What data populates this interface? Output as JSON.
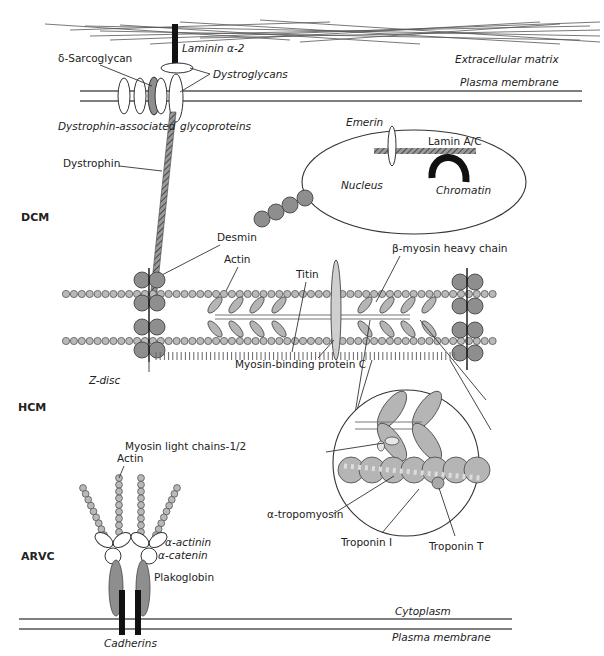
{
  "figure": {
    "regions": {
      "dcm": "DCM",
      "hcm": "HCM",
      "arvc": "ARVC"
    },
    "labels": {
      "laminin": "Laminin α-2",
      "extracellular_matrix": "Extracellular matrix",
      "plasma_membrane_top": "Plasma membrane",
      "delta_sarcoglycan": "δ-Sarcoglycan",
      "dystroglycans": "Dystroglycans",
      "dystrophin_associated": "Dystrophin-associated",
      "glycoproteins": "glycoproteins",
      "dystrophin": "Dystrophin",
      "emerin": "Emerin",
      "lamin_ac": "Lamin A/C",
      "nucleus": "Nucleus",
      "chromatin": "Chromatin",
      "desmin": "Desmin",
      "actin_sarcomere": "Actin",
      "titin": "Titin",
      "beta_myosin": "β-myosin heavy chain",
      "z_disc": "Z-disc",
      "mybpc": "Myosin-binding protein C",
      "myosin_light_chains": "Myosin light chains-1/2",
      "alpha_tropomyosin": "α-tropomyosin",
      "troponin_i": "Troponin I",
      "troponin_t": "Troponin T",
      "actin_arvc": "Actin",
      "alpha_actinin": "α-actinin",
      "alpha_catenin": "α-catenin",
      "plakoglobin": "Plakoglobin",
      "cadherins": "Cadherins",
      "cytoplasm": "Cytoplasm",
      "plasma_membrane_bottom": "Plasma membrane"
    },
    "colors": {
      "stroke": "#333333",
      "fill_light": "#b9b9b9",
      "fill_dark": "#8e8e8e",
      "black": "#111111"
    }
  }
}
